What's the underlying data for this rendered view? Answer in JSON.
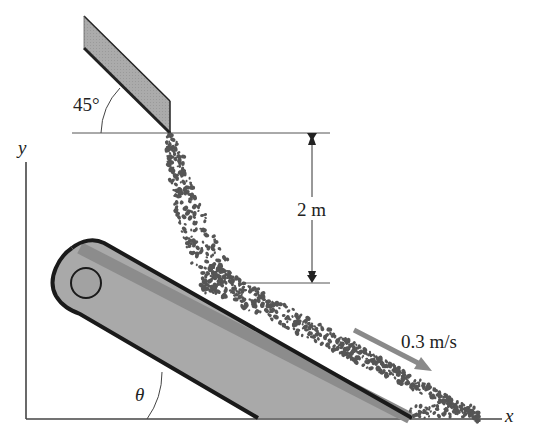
{
  "diagram": {
    "type": "physics-free-body-sketch",
    "labels": {
      "chute_angle": "45°",
      "drop_height": "2 m",
      "belt_speed": "0.3 m/s",
      "belt_angle": "θ",
      "axis_x": "x",
      "axis_y": "y"
    },
    "colors": {
      "background": "#ffffff",
      "outline": "#1a1a1a",
      "chute_fill": "#a8a8a8",
      "belt_fill": "#a9a9a9",
      "belt_band": "#8c8c8c",
      "gravel": "#555555",
      "velocity_arrow": "#888888",
      "lines": "#333333"
    }
  }
}
